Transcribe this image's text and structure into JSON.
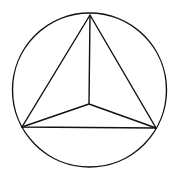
{
  "diagram": {
    "stroke": "#111111",
    "background": "#ffffff",
    "circle": {
      "cx": 89.5,
      "cy": 90,
      "r": 77
    },
    "vertices": {
      "top": {
        "x": 90,
        "y": 15
      },
      "left": {
        "x": 22,
        "y": 127
      },
      "right": {
        "x": 156,
        "y": 128
      },
      "inner": {
        "x": 89,
        "y": 104
      }
    }
  }
}
